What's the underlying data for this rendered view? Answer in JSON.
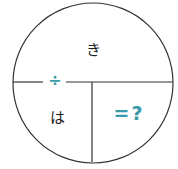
{
  "diagram": {
    "top_label": "き",
    "bottom_left_label": "は",
    "operator": "÷",
    "result": "=?",
    "colors": {
      "line": "#333333",
      "accent": "#3a9aa8"
    }
  }
}
